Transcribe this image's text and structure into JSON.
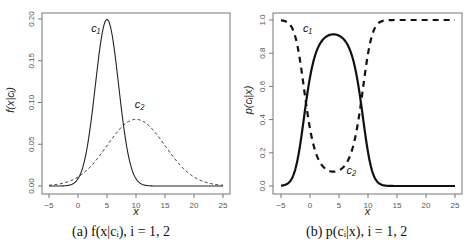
{
  "chart_data": [
    {
      "id": "a",
      "type": "line",
      "caption": "(a) f(x|cᵢ), i = 1, 2",
      "xlabel": "x",
      "ylabel": "f(x|cᵢ)",
      "xlim": [
        -5,
        25
      ],
      "ylim": [
        0,
        0.2
      ],
      "xticks": [
        -5,
        0,
        5,
        10,
        15,
        20,
        25
      ],
      "yticks": [
        "0.00",
        "0.05",
        "0.10",
        "0.15",
        "0.20"
      ],
      "grid": false,
      "series": [
        {
          "name": "c1",
          "label": "c₁",
          "style": "solid",
          "distribution": "normal",
          "mean": 5,
          "sd": 2,
          "peak": 0.1995,
          "label_pos": [
            2.3,
            0.185
          ]
        },
        {
          "name": "c2",
          "label": "c₂",
          "style": "dotted",
          "distribution": "normal",
          "mean": 10,
          "sd": 5,
          "peak": 0.0798,
          "label_pos": [
            9.8,
            0.093
          ]
        }
      ]
    },
    {
      "id": "b",
      "type": "line",
      "caption": "(b) p(cᵢ|x), i = 1, 2",
      "xlabel": "x",
      "ylabel": "p(cᵢ|x)",
      "xlim": [
        -5,
        25
      ],
      "ylim": [
        0,
        1.0
      ],
      "xticks": [
        -5,
        0,
        5,
        10,
        15,
        20,
        25
      ],
      "yticks": [
        "0.0",
        "0.2",
        "0.4",
        "0.6",
        "0.8",
        "1.0"
      ],
      "grid": false,
      "priors": {
        "c1": 0.7,
        "c2": 0.3
      },
      "series": [
        {
          "name": "c1",
          "label": "c₁",
          "style": "solid",
          "peak": 0.91,
          "peak_x": 4,
          "crossings_x": [
            -0.8,
            8.8
          ],
          "label_pos": [
            -1.2,
            0.93
          ]
        },
        {
          "name": "c2",
          "label": "c₂",
          "style": "dashed",
          "min": 0.09,
          "min_x": 4,
          "crossings_x": [
            -0.8,
            8.8
          ],
          "label_pos": [
            6.3,
            0.07
          ]
        }
      ]
    }
  ]
}
